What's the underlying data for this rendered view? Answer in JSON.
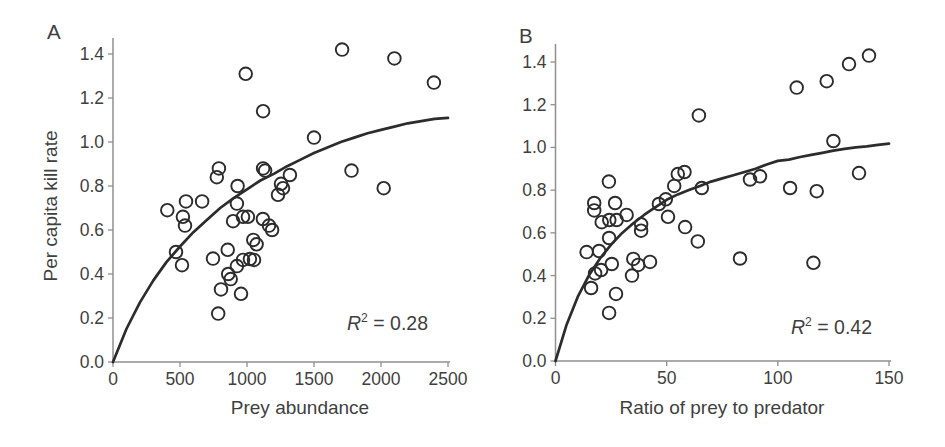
{
  "figure": {
    "colors": {
      "background": "#ffffff",
      "ink": "#2c2c2c",
      "axis": "#8f8f8f",
      "text": "#3f3f3f"
    },
    "panels": [
      {
        "panel_label": "A",
        "xlabel": "Prey abundance",
        "ylabel": "Per capita kill rate",
        "annotation": {
          "variable": "R",
          "exponent": "2",
          "rest": " = 0.28"
        }
      },
      {
        "panel_label": "B",
        "xlabel": "Ratio of prey to predator",
        "ylabel": "",
        "annotation": {
          "variable": "R",
          "exponent": "2",
          "rest": " = 0.42"
        }
      }
    ]
  },
  "chart_data": [
    {
      "type": "scatter",
      "panel": "A",
      "title": "",
      "xlabel": "Prey abundance",
      "ylabel": "Per capita kill rate",
      "xlim": [
        0,
        2500
      ],
      "ylim": [
        0,
        1.5
      ],
      "grid": false,
      "legend": null,
      "r_squared": 0.28,
      "xticks": [
        0,
        500,
        1000,
        1500,
        2000,
        2500
      ],
      "yticks": [
        0.0,
        0.2,
        0.4,
        0.6,
        0.8,
        1.0,
        1.2,
        1.4
      ],
      "ytick_labels": [
        "0.0",
        "0.2",
        "0.4",
        "0.6",
        "0.8",
        "1.0",
        "1.2",
        "1.4"
      ],
      "points": [
        [
          1710,
          1.42
        ],
        [
          2100,
          1.38
        ],
        [
          990,
          1.31
        ],
        [
          2395,
          1.27
        ],
        [
          1120,
          1.14
        ],
        [
          1500,
          1.02
        ],
        [
          790,
          0.88
        ],
        [
          775,
          0.84
        ],
        [
          1120,
          0.88
        ],
        [
          1135,
          0.87
        ],
        [
          1320,
          0.85
        ],
        [
          1780,
          0.87
        ],
        [
          930,
          0.8
        ],
        [
          1254,
          0.81
        ],
        [
          1269,
          0.79
        ],
        [
          1231,
          0.76
        ],
        [
          2020,
          0.79
        ],
        [
          925,
          0.72
        ],
        [
          405,
          0.69
        ],
        [
          545,
          0.73
        ],
        [
          522,
          0.66
        ],
        [
          537,
          0.62
        ],
        [
          665,
          0.73
        ],
        [
          896,
          0.64
        ],
        [
          970,
          0.66
        ],
        [
          1007,
          0.66
        ],
        [
          1119,
          0.65
        ],
        [
          1164,
          0.62
        ],
        [
          1187,
          0.6
        ],
        [
          1047,
          0.555
        ],
        [
          1072,
          0.535
        ],
        [
          470,
          0.5
        ],
        [
          856,
          0.51
        ],
        [
          515,
          0.44
        ],
        [
          746,
          0.47
        ],
        [
          970,
          0.464
        ],
        [
          1022,
          0.468
        ],
        [
          1052,
          0.464
        ],
        [
          925,
          0.436
        ],
        [
          860,
          0.4
        ],
        [
          878,
          0.377
        ],
        [
          806,
          0.33
        ],
        [
          955,
          0.31
        ],
        [
          785,
          0.22
        ]
      ],
      "fit_curve": [
        [
          0,
          0
        ],
        [
          100,
          0.15
        ],
        [
          200,
          0.27
        ],
        [
          300,
          0.37
        ],
        [
          400,
          0.455
        ],
        [
          500,
          0.525
        ],
        [
          600,
          0.59
        ],
        [
          700,
          0.645
        ],
        [
          800,
          0.7
        ],
        [
          900,
          0.745
        ],
        [
          1000,
          0.785
        ],
        [
          1100,
          0.825
        ],
        [
          1200,
          0.855
        ],
        [
          1300,
          0.89
        ],
        [
          1400,
          0.92
        ],
        [
          1500,
          0.95
        ],
        [
          1600,
          0.975
        ],
        [
          1700,
          1.0
        ],
        [
          1800,
          1.02
        ],
        [
          1900,
          1.04
        ],
        [
          2000,
          1.055
        ],
        [
          2100,
          1.07
        ],
        [
          2200,
          1.085
        ],
        [
          2300,
          1.095
        ],
        [
          2400,
          1.105
        ],
        [
          2500,
          1.11
        ]
      ]
    },
    {
      "type": "scatter",
      "panel": "B",
      "title": "",
      "xlabel": "Ratio of prey to predator",
      "ylabel": "Per capita kill rate",
      "xlim": [
        0,
        150
      ],
      "ylim": [
        0,
        1.5
      ],
      "grid": false,
      "legend": null,
      "r_squared": 0.42,
      "xticks": [
        0,
        50,
        100,
        150
      ],
      "yticks": [
        0.0,
        0.2,
        0.4,
        0.6,
        0.8,
        1.0,
        1.2,
        1.4
      ],
      "ytick_labels": [
        "0.0",
        "0.2",
        "0.4",
        "0.6",
        "0.8",
        "1.0",
        "1.2",
        "1.4"
      ],
      "points": [
        [
          141,
          1.43
        ],
        [
          132,
          1.39
        ],
        [
          122,
          1.31
        ],
        [
          108.5,
          1.28
        ],
        [
          64.5,
          1.15
        ],
        [
          125,
          1.03
        ],
        [
          58,
          0.885
        ],
        [
          55,
          0.875
        ],
        [
          136.5,
          0.88
        ],
        [
          92,
          0.865
        ],
        [
          87.5,
          0.85
        ],
        [
          24,
          0.84
        ],
        [
          53.4,
          0.82
        ],
        [
          65.8,
          0.81
        ],
        [
          105.5,
          0.81
        ],
        [
          117.5,
          0.795
        ],
        [
          49.6,
          0.757
        ],
        [
          46.5,
          0.735
        ],
        [
          17.4,
          0.74
        ],
        [
          26.8,
          0.74
        ],
        [
          17.4,
          0.705
        ],
        [
          32,
          0.684
        ],
        [
          50.6,
          0.675
        ],
        [
          20.8,
          0.65
        ],
        [
          24.2,
          0.66
        ],
        [
          27.5,
          0.66
        ],
        [
          38.5,
          0.64
        ],
        [
          38.5,
          0.61
        ],
        [
          58.3,
          0.627
        ],
        [
          24.1,
          0.576
        ],
        [
          64,
          0.56
        ],
        [
          14,
          0.51
        ],
        [
          19.6,
          0.515
        ],
        [
          83,
          0.48
        ],
        [
          35,
          0.478
        ],
        [
          25.3,
          0.454
        ],
        [
          37.2,
          0.45
        ],
        [
          42.5,
          0.464
        ],
        [
          116,
          0.46
        ],
        [
          17.8,
          0.41
        ],
        [
          20.5,
          0.426
        ],
        [
          34.4,
          0.4
        ],
        [
          16,
          0.342
        ],
        [
          27.2,
          0.314
        ],
        [
          24.1,
          0.225
        ]
      ],
      "fit_curve": [
        [
          0,
          0
        ],
        [
          5,
          0.17
        ],
        [
          10,
          0.3
        ],
        [
          15,
          0.4
        ],
        [
          20,
          0.48
        ],
        [
          25,
          0.545
        ],
        [
          30,
          0.6
        ],
        [
          35,
          0.645
        ],
        [
          40,
          0.685
        ],
        [
          45,
          0.72
        ],
        [
          50,
          0.755
        ],
        [
          55,
          0.78
        ],
        [
          60,
          0.8
        ],
        [
          65,
          0.82
        ],
        [
          70,
          0.84
        ],
        [
          75,
          0.855
        ],
        [
          80,
          0.87
        ],
        [
          85,
          0.885
        ],
        [
          90,
          0.9
        ],
        [
          95,
          0.92
        ],
        [
          100,
          0.937
        ],
        [
          105,
          0.943
        ],
        [
          110,
          0.955
        ],
        [
          115,
          0.965
        ],
        [
          120,
          0.975
        ],
        [
          125,
          0.985
        ],
        [
          130,
          0.993
        ],
        [
          135,
          1.0
        ],
        [
          140,
          1.005
        ],
        [
          145,
          1.012
        ],
        [
          150,
          1.018
        ]
      ]
    }
  ]
}
